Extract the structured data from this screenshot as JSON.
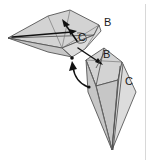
{
  "figure": {
    "background_color": "#ffffff",
    "paper_fill_color": "#d3d3d3",
    "paper_edge_color": "#555555",
    "arrow_color": "#111111",
    "label_color": "#1a1a1a",
    "frame_color": "#d8d8d8"
  },
  "labels": {
    "upper_b": "B",
    "upper_c": "C",
    "lower_b": "B",
    "lower_c": "C"
  },
  "annotations": {
    "arrow_fold_up": "fold-arrow-up-left",
    "arrow_rotate": "curved-rotation-arrow",
    "arrow_pointer_b": "pointer-arrow-to-b",
    "arrow_pointer_c": "pointer-arrow-to-c"
  },
  "shapes": {
    "upper_unit_name": "upper-folded-paper-unit",
    "lower_unit_name": "lower-folded-paper-unit"
  }
}
